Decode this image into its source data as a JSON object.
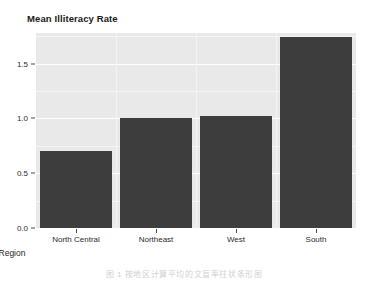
{
  "chart_data": {
    "type": "bar",
    "title": "Mean Illiteracy Rate",
    "xlabel": "Region",
    "ylabel": "",
    "categories": [
      "North Central",
      "Northeast",
      "West",
      "South"
    ],
    "values": [
      0.7,
      1.0,
      1.02,
      1.74
    ],
    "ylim": [
      0.0,
      1.78
    ],
    "yticks": [
      0.0,
      0.5,
      1.0,
      1.5
    ],
    "ytick_labels": [
      "0.0",
      "0.5",
      "1.0",
      "1.5"
    ],
    "grid": true,
    "legend": null,
    "bar_color": "#3d3d3d",
    "panel_color": "#e9e9e9",
    "gridline_color": "#ffffff"
  },
  "title": {
    "text": "Mean Illiteracy Rate"
  },
  "axes": {
    "x_title": "Region",
    "x_labels": [
      "North Central",
      "Northeast",
      "West",
      "South"
    ],
    "y_labels": [
      "1.5",
      "1.0",
      "0.5",
      "0.0"
    ]
  },
  "caption": {
    "text": "图 1  按地区计算平均的文盲率柱状条形图"
  }
}
